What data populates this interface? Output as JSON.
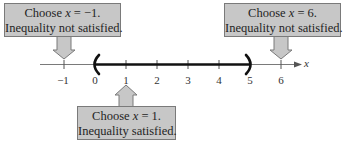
{
  "diagram": {
    "type": "number-line-test-intervals",
    "axis": {
      "variable": "x",
      "min": -1,
      "max": 6,
      "ticks": [
        {
          "value": -1,
          "label": "−1"
        },
        {
          "value": 0,
          "label": "0"
        },
        {
          "value": 1,
          "label": "1"
        },
        {
          "value": 2,
          "label": "2"
        },
        {
          "value": 3,
          "label": "3"
        },
        {
          "value": 4,
          "label": "4"
        },
        {
          "value": 5,
          "label": "5"
        },
        {
          "value": 6,
          "label": "6"
        }
      ]
    },
    "interval": {
      "start": 0,
      "end": 5,
      "start_bracket": "(",
      "end_bracket": ")",
      "open": true
    },
    "callouts": [
      {
        "id": "left",
        "points_to": -1,
        "direction": "down",
        "line1_prefix": "Choose ",
        "line1_var": "x",
        "line1_suffix": " = −1.",
        "line2": "Inequality not satisfied."
      },
      {
        "id": "right",
        "points_to": 6,
        "direction": "down",
        "line1_prefix": "Choose ",
        "line1_var": "x",
        "line1_suffix": " = 6.",
        "line2": "Inequality not satisfied."
      },
      {
        "id": "bottom",
        "points_to": 1,
        "direction": "up",
        "line1_prefix": "Choose ",
        "line1_var": "x",
        "line1_suffix": " = 1.",
        "line2": "Inequality satisfied."
      }
    ],
    "colors": {
      "callout_fill": "#c7c7c7",
      "callout_border": "#7a7a7a",
      "axis": "#777777",
      "interval": "#111111"
    }
  }
}
